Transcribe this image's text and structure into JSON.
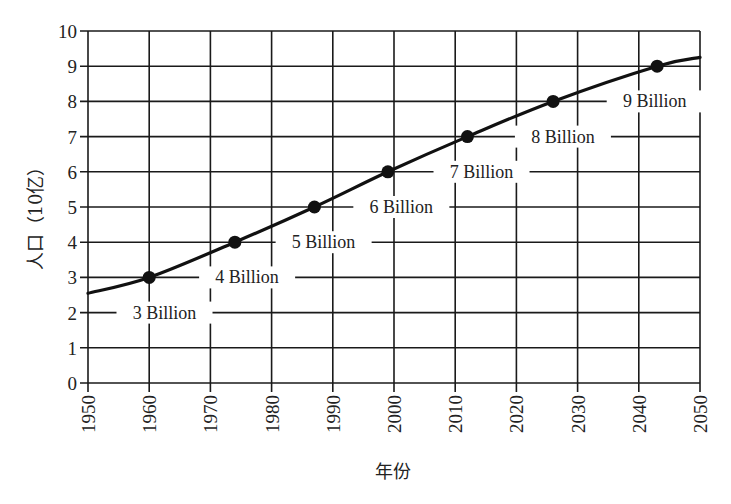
{
  "chart_data": {
    "type": "line",
    "title": "",
    "xlabel": "年份",
    "ylabel": "人口（10亿）",
    "xlim": [
      1950,
      2050
    ],
    "ylim": [
      0,
      10
    ],
    "grid": true,
    "legend": null,
    "x_ticks": [
      "1950",
      "1960",
      "1970",
      "1980",
      "1990",
      "2000",
      "2010",
      "2020",
      "2030",
      "2040",
      "2050"
    ],
    "y_ticks": [
      "0",
      "1",
      "2",
      "3",
      "4",
      "5",
      "6",
      "7",
      "8",
      "9",
      "10"
    ],
    "series": [
      {
        "name": "World population",
        "x": [
          1950,
          1960,
          1974,
          1987,
          1999,
          2012,
          2026,
          2043,
          2050
        ],
        "values": [
          2.55,
          3.0,
          4.0,
          5.0,
          6.0,
          7.0,
          8.0,
          9.0,
          9.25
        ]
      }
    ],
    "milestones": [
      {
        "x": 1960,
        "y": 3,
        "label": "3 Billion"
      },
      {
        "x": 1974,
        "y": 4,
        "label": "4 Billion"
      },
      {
        "x": 1987,
        "y": 5,
        "label": "5 Billion"
      },
      {
        "x": 1999,
        "y": 6,
        "label": "6 Billion"
      },
      {
        "x": 2012,
        "y": 7,
        "label": "7 Billion"
      },
      {
        "x": 2026,
        "y": 8,
        "label": "8 Billion"
      },
      {
        "x": 2043,
        "y": 9,
        "label": "9 Billion"
      }
    ]
  },
  "colors": {
    "line": "#111111",
    "grid": "#1a1a1a",
    "background": "#ffffff"
  }
}
